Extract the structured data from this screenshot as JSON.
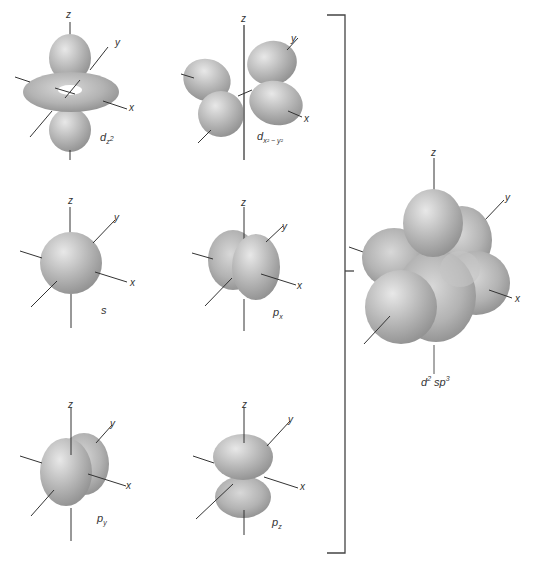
{
  "diagram": {
    "type": "orbital-hybridization",
    "axis_labels": {
      "x": "x",
      "y": "y",
      "z": "z"
    },
    "orbitals": [
      {
        "id": "dz2",
        "base": "d",
        "sub": "z",
        "sub_sup": "2",
        "label_text": "dz²"
      },
      {
        "id": "dx2y2",
        "base": "d",
        "sub": "x² − y²",
        "label_text": "dx²−y²"
      },
      {
        "id": "s",
        "base": "s",
        "label_text": "s"
      },
      {
        "id": "px",
        "base": "p",
        "sub": "x",
        "label_text": "px"
      },
      {
        "id": "py",
        "base": "p",
        "sub": "y",
        "label_text": "py"
      },
      {
        "id": "pz",
        "base": "p",
        "sub": "z",
        "label_text": "pz"
      }
    ],
    "result": {
      "id": "d2sp3",
      "base1": "d",
      "sup1": "2",
      "base2": "sp",
      "sup2": "3",
      "label_text": "d²sp³"
    },
    "colors": {
      "lobe": "#b8b8b8",
      "lobe_highlight": "#e6e6e6",
      "lobe_shadow": "#8f8f8f",
      "axis": "#333333",
      "bracket": "#444444"
    }
  }
}
